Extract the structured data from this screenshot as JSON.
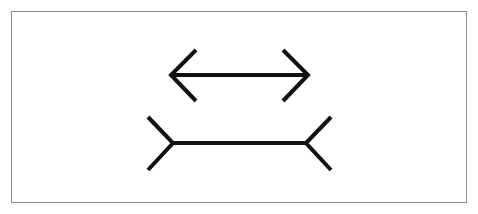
{
  "figure": {
    "name": "muller-lyer-illusion",
    "background_color": "#ffffff",
    "stroke_color": "#111111"
  },
  "frame": {
    "name": "outer-border",
    "x": 11.5,
    "y": 11.5,
    "width": 455,
    "height": 191,
    "stroke_color": "#8c8c8c",
    "stroke_width": 1,
    "fill_color": "#ffffff"
  },
  "shapes": {
    "top_figure": {
      "label": "inward-arrowheads-figure",
      "shaft_y": 75,
      "shaft_x_start": 172,
      "shaft_x_end": 307,
      "shaft_length": 135,
      "stroke_width": 4,
      "shaft_path": "M 172 75 L 307 75",
      "left_head_path": "M 196 50 L 171 75 L 196 101",
      "right_head_path": "M 283 50 L 308 75 L 283 101",
      "head_top_y": 50,
      "head_bottom_y": 101,
      "fin_direction": "inward"
    },
    "bottom_figure": {
      "label": "outward-fins-figure",
      "shaft_y": 143,
      "shaft_x_start": 172,
      "shaft_x_end": 307,
      "shaft_length": 135,
      "stroke_width": 4,
      "shaft_path": "M 172 143 L 307 143",
      "left_head_path": "M 148 117 L 173 143 L 148 170",
      "right_head_path": "M 331 117 L 306 143 L 331 170",
      "head_top_y": 117,
      "head_bottom_y": 170,
      "fin_direction": "outward"
    }
  }
}
